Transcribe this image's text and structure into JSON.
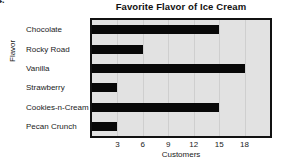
{
  "corner_mark": "4.",
  "chart_data": {
    "type": "bar",
    "orientation": "horizontal",
    "title": "Favorite Flavor of Ice Cream",
    "xlabel": "Customers",
    "ylabel": "Flavor",
    "categories": [
      "Chocolate",
      "Rocky Road",
      "Vanilla",
      "Strawberry",
      "Cookies-n-Cream",
      "Pecan Crunch"
    ],
    "values": [
      15,
      6,
      18,
      3,
      15,
      3
    ],
    "xticks": [
      3,
      6,
      9,
      12,
      15,
      18
    ],
    "xlim": [
      0,
      21
    ],
    "grid": true,
    "legend": "none",
    "bar_color": "#080808",
    "plot_background": "#e2e2e2",
    "frame_color": "#111111"
  }
}
